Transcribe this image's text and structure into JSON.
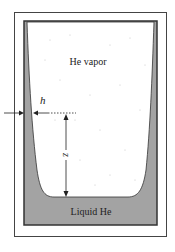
{
  "diagram": {
    "labels": {
      "vapor": "He vapor",
      "liquid": "Liquid He",
      "film_thickness": "h",
      "height": "z"
    },
    "colors": {
      "background": "#ffffff",
      "frame": "#333333",
      "liquid": "#a3a3a3",
      "vapor_speckle": "#bbbbbb",
      "arrow": "#222222"
    }
  }
}
